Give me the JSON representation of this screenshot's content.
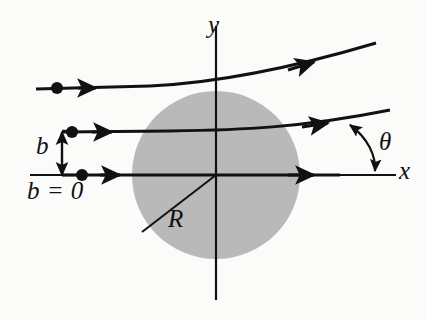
{
  "figure": {
    "background_color": "#fbfbfa",
    "ink_color": "#111111",
    "disk_color": "#b9b9b9"
  },
  "axes": {
    "x_label": "x",
    "y_label": "y",
    "origin": {
      "x": 216,
      "y": 175
    },
    "x_axis": {
      "x1": 30,
      "y1": 175,
      "x2": 396,
      "y2": 175
    },
    "y_axis": {
      "x1": 216,
      "y1": 26,
      "x2": 216,
      "y2": 300
    }
  },
  "target": {
    "radius_label": "R",
    "center": {
      "x": 216,
      "y": 175
    },
    "radius_px": 84,
    "radius_line": {
      "x1": 216,
      "y1": 175,
      "x2": 142,
      "y2": 232
    }
  },
  "impact_parameter": {
    "label": "b",
    "zero_label": "b = 0",
    "arrow": {
      "x": 62,
      "y_top": 132,
      "y_bottom": 175
    }
  },
  "scattering_angle": {
    "label": "θ",
    "arc_start": {
      "x": 349,
      "y": 124
    },
    "arc_end": {
      "x": 374,
      "y": 173
    }
  },
  "trajectories": [
    {
      "name": "upper-trajectory",
      "impact_parameter": "large",
      "particle_dot": {
        "x": 57,
        "y": 88
      },
      "entry_arrowhead": {
        "x": 88,
        "y": 88
      },
      "exit_arrowhead": {
        "x": 312,
        "y": 62
      },
      "path": "M 36 89 L 150 86 C 215 83 285 70 376 43",
      "end_point": {
        "x": 376,
        "y": 43
      }
    },
    {
      "name": "middle-trajectory",
      "impact_parameter": "b",
      "particle_dot": {
        "x": 72,
        "y": 132
      },
      "entry_arrowhead": {
        "x": 104,
        "y": 132
      },
      "exit_arrowhead": {
        "x": 326,
        "y": 124
      },
      "path": "M 62 132 L 170 131 C 240 130 300 128 390 110",
      "end_point": {
        "x": 390,
        "y": 110
      }
    },
    {
      "name": "axial-trajectory",
      "impact_parameter": "b = 0",
      "particle_dot": {
        "x": 82,
        "y": 175
      },
      "entry_arrowhead": {
        "x": 112,
        "y": 175
      },
      "exit_arrowhead": {
        "x": 312,
        "y": 175
      },
      "path": "M 62 175 L 340 175",
      "end_point": {
        "x": 340,
        "y": 175
      }
    }
  ]
}
